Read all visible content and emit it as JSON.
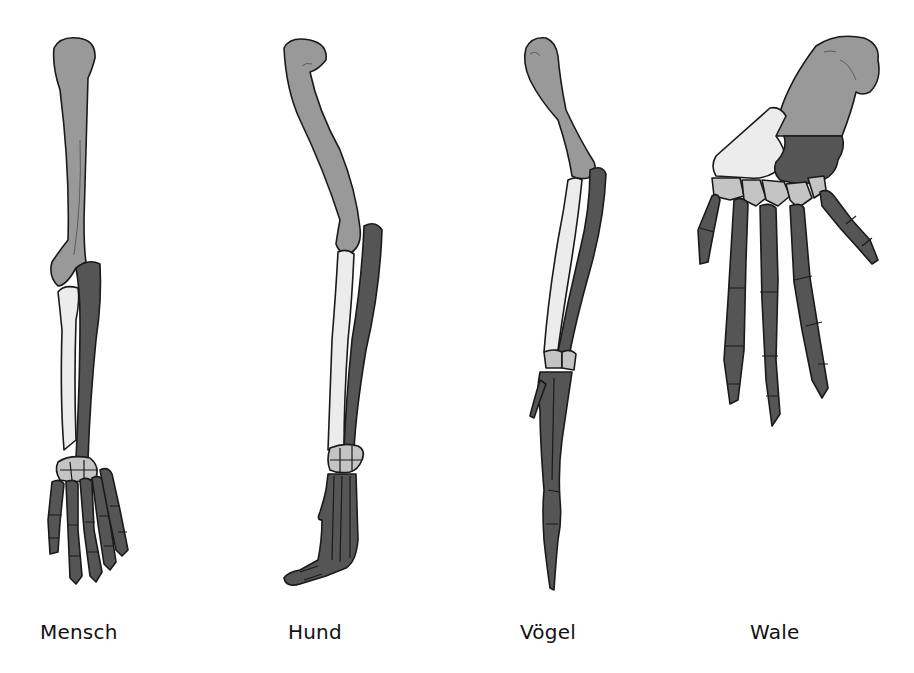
{
  "diagram": {
    "legend_colors": {
      "humerus": "#999999",
      "radius": "#ececec",
      "ulna": "#555555",
      "carpals": "#c4c4c4",
      "hand_bones": "#555555"
    },
    "specimens": [
      {
        "label": "Mensch"
      },
      {
        "label": "Hund"
      },
      {
        "label": "Vögel"
      },
      {
        "label": "Wale"
      }
    ]
  }
}
